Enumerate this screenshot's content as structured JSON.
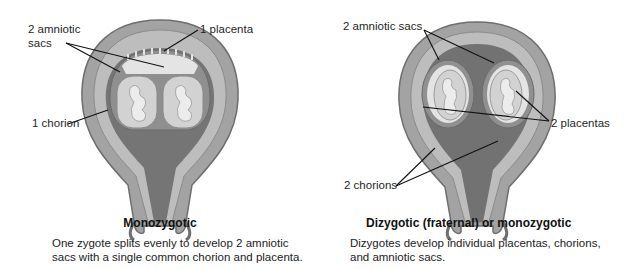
{
  "colors": {
    "outer_wall": "#9a9a9a",
    "wall_edge": "#6e6e6e",
    "inner_wall": "#b9b9b9",
    "cavity_dark": "#707070",
    "chorion": "#8d8d8d",
    "placenta": "#e6e6e6",
    "sac": "#cfcfcf",
    "fetus": "#efefef",
    "leader_line": "#111111"
  },
  "left": {
    "labels": {
      "amniotic_line1": "2 amniotic",
      "amniotic_line2": "sacs",
      "placenta": "1 placenta",
      "chorion": "1 chorion"
    },
    "title": "Monozygotic",
    "caption_line1": "One zygote splits evenly to develop 2 amniotic",
    "caption_line2": "sacs with a single common chorion and placenta."
  },
  "right": {
    "labels": {
      "amniotic": "2 amniotic sacs",
      "placentas": "2 placentas",
      "chorions": "2 chorions"
    },
    "title": "Dizygotic (fraternal) or monozygotic",
    "caption_line1": "Dizygotes develop individual placentas, chorions,",
    "caption_line2": "and amniotic sacs."
  }
}
